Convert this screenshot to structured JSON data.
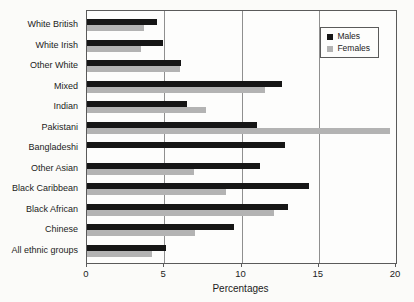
{
  "chart_data": {
    "type": "bar",
    "orientation": "horizontal",
    "title": "",
    "xlabel": "Percentages",
    "ylabel": "",
    "xlim": [
      0,
      20
    ],
    "xticks": [
      0,
      5,
      10,
      15,
      20
    ],
    "grid": "vertical",
    "legend_position": "top-right",
    "categories": [
      "White British",
      "White Irish",
      "Other White",
      "Mixed",
      "Indian",
      "Pakistani",
      "Bangladeshi",
      "Other Asian",
      "Black Caribbean",
      "Black African",
      "Chinese",
      "All ethnic groups"
    ],
    "series": [
      {
        "name": "Males",
        "color": "#161616",
        "values": [
          4.5,
          4.9,
          6.1,
          12.6,
          6.5,
          11.0,
          12.8,
          11.2,
          14.4,
          13.0,
          9.5,
          5.1
        ]
      },
      {
        "name": "Females",
        "color": "#b3b3b3",
        "values": [
          3.7,
          3.5,
          6.0,
          11.5,
          7.7,
          19.6,
          null,
          6.9,
          9.0,
          12.1,
          7.0,
          4.2
        ]
      }
    ]
  },
  "colors": {
    "plot_border": "#5a5a5a",
    "gridline": "#8f8f8f",
    "background": "#fbfbf9"
  }
}
